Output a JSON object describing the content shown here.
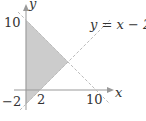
{
  "figure": {
    "axes": {
      "x_label": "x",
      "y_label": "y",
      "x_ticks": [
        "2",
        "10"
      ],
      "y_ticks": [
        "10",
        "−2"
      ]
    },
    "lines": [
      {
        "name": "line-y-equals-x-minus-2",
        "label": "y = x − 2",
        "style": "dashed"
      },
      {
        "name": "line-y-equals-10-minus-x",
        "label": "",
        "style": "dashed"
      }
    ],
    "shaded_region": {
      "vertices": [
        [
          0,
          10
        ],
        [
          6,
          4
        ],
        [
          0,
          -2
        ]
      ],
      "fill": "#cccccc"
    },
    "colors": {
      "axis": "#999999",
      "dashed_line": "#bbbbbb",
      "shade": "#cccccc",
      "text": "#333333"
    }
  }
}
